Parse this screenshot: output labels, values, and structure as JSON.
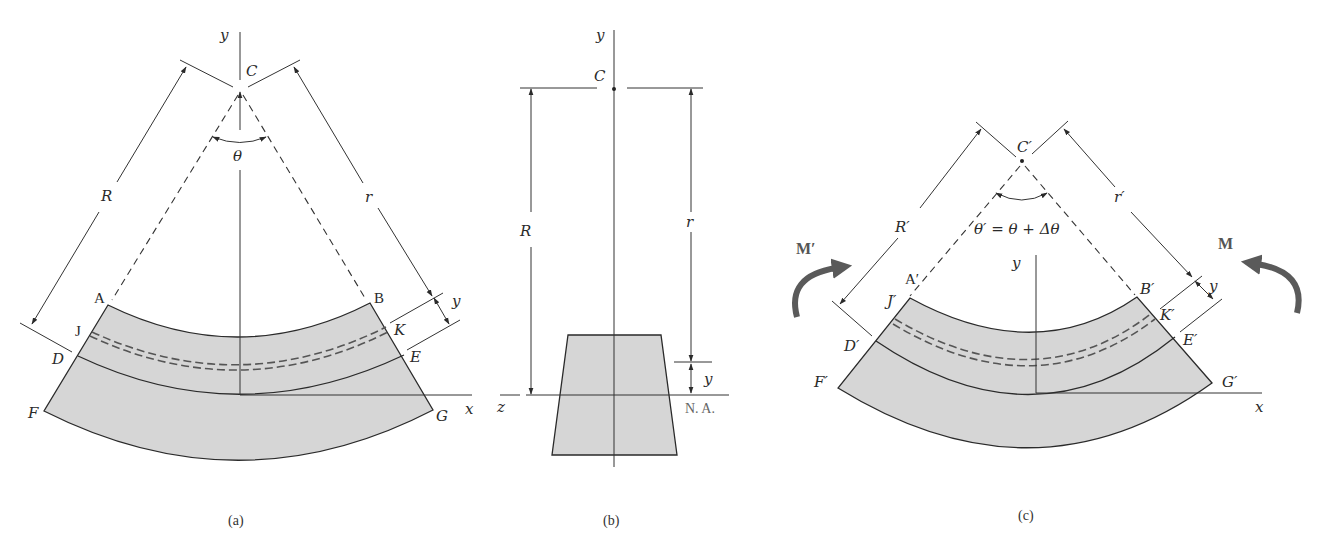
{
  "figure": {
    "panels": [
      {
        "id": "a",
        "caption": "(a)",
        "axes": {
          "vertical": "y",
          "horizontal": "x"
        },
        "center_label": "C",
        "angle_label": "θ",
        "dimension_labels": {
          "outer_radius": "R",
          "inner_radius": "r",
          "offset": "y"
        },
        "point_labels": [
          "A",
          "B",
          "J",
          "K",
          "D",
          "E",
          "F",
          "G"
        ]
      },
      {
        "id": "b",
        "caption": "(b)",
        "axes": {
          "vertical": "y",
          "horizontal": "z"
        },
        "center_label": "C",
        "dimension_labels": {
          "outer_radius": "R",
          "inner_radius": "r",
          "offset": "y"
        },
        "neutral_axis_label": "N. A."
      },
      {
        "id": "c",
        "caption": "(c)",
        "axes": {
          "vertical": "y",
          "horizontal": "x"
        },
        "center_label": "C′",
        "angle_label": "θ′ = θ + Δθ",
        "dimension_labels": {
          "outer_radius": "R′",
          "inner_radius": "r′",
          "offset": "y"
        },
        "moment_labels": {
          "left": "M′",
          "right": "M"
        },
        "point_labels": [
          "A′",
          "B′",
          "J′",
          "K′",
          "D′",
          "E′",
          "F′",
          "G′"
        ]
      }
    ]
  },
  "labels": {
    "a": {
      "y": "y",
      "C": "C",
      "theta": "θ",
      "R": "R",
      "r": "r",
      "yoff": "y",
      "A": "A",
      "B": "B",
      "J": "J",
      "K": "K",
      "D": "D",
      "E": "E",
      "F": "F",
      "G": "G",
      "x": "x",
      "caption": "(a)"
    },
    "b": {
      "y": "y",
      "C": "C",
      "R": "R",
      "r": "r",
      "yoff": "y",
      "z": "z",
      "na": "N. A.",
      "caption": "(b)"
    },
    "c": {
      "Cp": "C′",
      "Rp": "R′",
      "rp": "r′",
      "angle": "θ′ = θ + Δθ",
      "Mp": "M′",
      "M": "M",
      "y": "y",
      "yoff": "y",
      "Ap": "A′",
      "Bp": "B′",
      "Jp": "J′",
      "Kp": "K′",
      "Dp": "D′",
      "Ep": "E′",
      "Fp": "F′",
      "Gp": "G′",
      "x": "x",
      "caption": "(c)"
    }
  },
  "colors": {
    "section_fill": "#d6d6d6",
    "line": "#2a2a2a",
    "moment_arrow": "#5a5a5a"
  }
}
